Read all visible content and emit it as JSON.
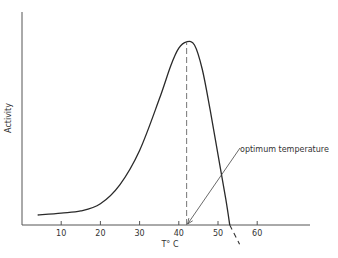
{
  "chart_data": {
    "type": "line",
    "title": "",
    "xlabel": "T° C",
    "ylabel": "Activity",
    "xlim": [
      0,
      72
    ],
    "ylim": [
      0,
      100
    ],
    "x_ticks": [
      10,
      20,
      30,
      40,
      50,
      60
    ],
    "x_tick_labels": [
      "10",
      "20",
      "30",
      "40",
      "50",
      "60"
    ],
    "y_ticks": [],
    "grid": false,
    "series": [
      {
        "name": "Enzyme activity",
        "style": "solid",
        "points": [
          {
            "x": 4,
            "y": 4.7
          },
          {
            "x": 10,
            "y": 5.6
          },
          {
            "x": 15,
            "y": 6.6
          },
          {
            "x": 20,
            "y": 10
          },
          {
            "x": 25,
            "y": 19
          },
          {
            "x": 30,
            "y": 35
          },
          {
            "x": 35,
            "y": 59
          },
          {
            "x": 38,
            "y": 75
          },
          {
            "x": 40,
            "y": 83
          },
          {
            "x": 42,
            "y": 86
          },
          {
            "x": 44,
            "y": 84.5
          },
          {
            "x": 46,
            "y": 73
          },
          {
            "x": 48,
            "y": 54
          },
          {
            "x": 50,
            "y": 33
          },
          {
            "x": 52,
            "y": 12
          },
          {
            "x": 53,
            "y": 0
          }
        ]
      },
      {
        "name": "Extrapolated decline",
        "style": "dashed",
        "points": [
          {
            "x": 53,
            "y": 0
          },
          {
            "x": 55.5,
            "y": -9
          }
        ]
      }
    ],
    "annotations": [
      {
        "type": "vertical-dashed-line",
        "x": 42,
        "y_from": 0,
        "y_to": 86
      },
      {
        "type": "arrow-label",
        "text": "optimum temperature",
        "points_to": {
          "x": 42,
          "y": 0
        }
      }
    ]
  }
}
